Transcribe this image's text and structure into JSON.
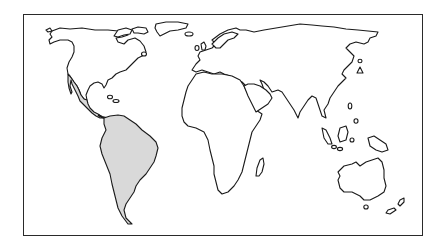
{
  "map": {
    "title": "World map – Latin America highlighted",
    "projection": "simplified equirectangular outline",
    "frame_color": "#2a2a2a",
    "outline_color": "#1a1a1a",
    "land_fill": "#ffffff",
    "highlight_fill": "#d9d9d9",
    "highlighted_region": "Latin America (Mexico, Central America, South America)",
    "regions": [
      {
        "id": "north-america",
        "label": "North America",
        "highlighted": false
      },
      {
        "id": "mexico-central-america",
        "label": "Mexico and Central America",
        "highlighted": true
      },
      {
        "id": "south-america",
        "label": "South America",
        "highlighted": true
      },
      {
        "id": "greenland",
        "label": "Greenland",
        "highlighted": false
      },
      {
        "id": "europe-asia",
        "label": "Eurasia",
        "highlighted": false
      },
      {
        "id": "africa",
        "label": "Africa",
        "highlighted": false
      },
      {
        "id": "madagascar",
        "label": "Madagascar",
        "highlighted": false
      },
      {
        "id": "arabia",
        "label": "Arabian Peninsula",
        "highlighted": false
      },
      {
        "id": "japan",
        "label": "Japan",
        "highlighted": false
      },
      {
        "id": "southeast-asia-islands",
        "label": "Southeast Asian islands",
        "highlighted": false
      },
      {
        "id": "new-guinea",
        "label": "New Guinea",
        "highlighted": false
      },
      {
        "id": "australia",
        "label": "Australia",
        "highlighted": false
      },
      {
        "id": "new-zealand",
        "label": "New Zealand",
        "highlighted": false
      },
      {
        "id": "british-isles",
        "label": "British Isles",
        "highlighted": false
      },
      {
        "id": "caribbean-islands",
        "label": "Caribbean islands",
        "highlighted": false
      }
    ]
  }
}
